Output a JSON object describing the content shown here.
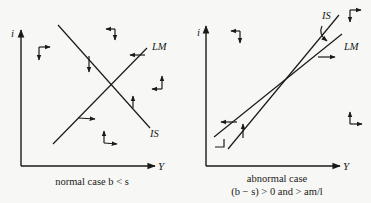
{
  "left_panel": {
    "y_axis_label": "i",
    "x_axis_label": "Y",
    "curve_labels": {
      "lm": "LM",
      "is": "IS"
    },
    "caption": "normal case  b < s"
  },
  "right_panel": {
    "y_axis_label": "i",
    "x_axis_label": "Y",
    "curve_labels": {
      "is": "IS",
      "lm": "LM"
    },
    "caption_line1": "abnormal case",
    "caption_line2": "(b − s) > 0 and > am/l"
  },
  "colors": {
    "ink": "#1a1a1a",
    "paper": "#f7f7f5"
  }
}
